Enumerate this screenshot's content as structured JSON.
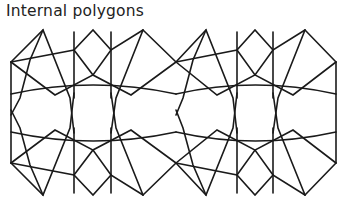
{
  "title": "Internal polygons",
  "diagram": {
    "rosettes": 2,
    "stroke_color": "#1a1a1a",
    "background": "#ffffff"
  }
}
